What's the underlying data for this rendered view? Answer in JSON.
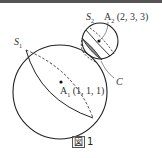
{
  "figure": {
    "caption_box": "図",
    "caption_number": "1"
  },
  "spheres": {
    "s1": {
      "label": "S",
      "sub": "1",
      "center_label": "A",
      "center_sub": "1",
      "center_coords": "(1, 1, 1)"
    },
    "s2": {
      "label": "S",
      "sub": "2",
      "center_label": "A",
      "center_sub": "2",
      "center_coords": "(2, 3, 3)"
    }
  },
  "intersection": {
    "label": "C"
  },
  "colors": {
    "stroke": "#222222",
    "lens_fill": "#888888",
    "topbar": "#555555"
  }
}
